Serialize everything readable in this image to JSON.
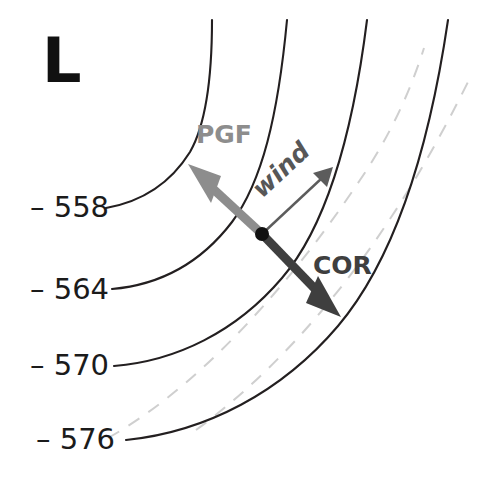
{
  "figure": {
    "background_color": "#ffffff",
    "width": 488,
    "height": 477
  },
  "pressure_system": {
    "symbol": "L",
    "meaning": "low-pressure center",
    "position": "upper-left"
  },
  "contours": {
    "units": "decameters (500 mb height)",
    "style": "solid",
    "color": "#231f20",
    "labels": [
      {
        "value": "558",
        "dash_prefix": "–",
        "text": "– 558",
        "x": 30,
        "y": 217
      },
      {
        "value": "564",
        "dash_prefix": "–",
        "text": "– 564",
        "x": 30,
        "y": 299
      },
      {
        "value": "570",
        "dash_prefix": "–",
        "text": "– 570",
        "x": 30,
        "y": 375
      },
      {
        "value": "576",
        "dash_prefix": "–",
        "text": "– 576",
        "x": 36,
        "y": 449
      }
    ]
  },
  "radial_guides": {
    "style": "dashed",
    "color": "#cfcfcf",
    "count": 2
  },
  "vectors": [
    {
      "id": "pgf",
      "label": "PGF",
      "full_name": "pressure gradient force",
      "color": "#8d8d8d",
      "direction": "up-left, toward the low",
      "label_x": 196,
      "label_y": 143
    },
    {
      "id": "wind",
      "label": "wind",
      "full_name": "geostrophic wind",
      "color": "#5c5c5c",
      "direction": "up-right, parallel to contours",
      "label_x": 262,
      "label_y": 199
    },
    {
      "id": "cor",
      "label": "COR",
      "full_name": "Coriolis force",
      "color": "#3f3f3f",
      "direction": "down-right, away from the low",
      "label_x": 313,
      "label_y": 274
    }
  ],
  "origin_point": {
    "name": "air-parcel",
    "x": 262,
    "y": 234
  }
}
